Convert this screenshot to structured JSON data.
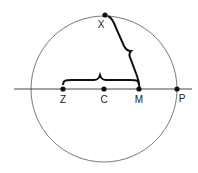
{
  "diagram": {
    "title": "",
    "points": [
      {
        "id": "X",
        "label": "X"
      },
      {
        "id": "Z",
        "label": "Z"
      },
      {
        "id": "C",
        "label": "C"
      },
      {
        "id": "M",
        "label": "M"
      },
      {
        "id": "P",
        "label": "P"
      }
    ],
    "shapes": {
      "circle": {
        "center": "C",
        "passes_through": [
          "X",
          "P"
        ]
      },
      "line": {
        "through": [
          "Z",
          "C",
          "M",
          "P"
        ]
      }
    },
    "braces": [
      {
        "from": "Z",
        "to": "M",
        "label": ""
      },
      {
        "from": "X",
        "to": "M",
        "label": ""
      }
    ],
    "colors": {
      "stroke": "#222222",
      "circle": "#555555"
    }
  }
}
